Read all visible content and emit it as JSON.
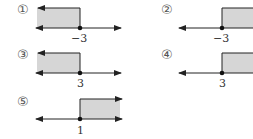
{
  "diagram": {
    "type": "number-line-inequality-choices",
    "colors": {
      "shade": "#d6d6d6",
      "line": "#222222",
      "point": "#111111"
    },
    "options": [
      {
        "id": 1,
        "marker": "①",
        "point_label": "−3",
        "shade_direction": "left"
      },
      {
        "id": 2,
        "marker": "②",
        "point_label": "−3",
        "shade_direction": "right"
      },
      {
        "id": 3,
        "marker": "③",
        "point_label": "3",
        "shade_direction": "left"
      },
      {
        "id": 4,
        "marker": "④",
        "point_label": "3",
        "shade_direction": "right"
      },
      {
        "id": 5,
        "marker": "⑤",
        "point_label": "1",
        "shade_direction": "right"
      }
    ]
  }
}
